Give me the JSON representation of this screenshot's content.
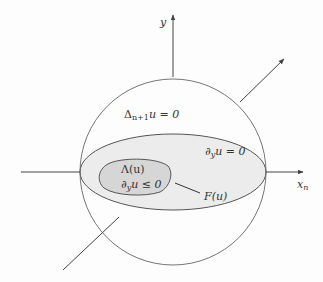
{
  "diagram": {
    "type": "schematic",
    "axes": {
      "vertical": {
        "label": "y"
      },
      "horizontal": {
        "label": "x",
        "subscript": "n"
      }
    },
    "regions": {
      "ball": {
        "label_main": "Δ",
        "label_sub": "n+1",
        "label_rest": "u = 0"
      },
      "ellipse": {
        "label_main": "∂",
        "label_sub": "y",
        "label_rest": "u = 0"
      },
      "contact_set": {
        "name": "Λ(u)",
        "condition_main": "∂",
        "condition_sub": "y",
        "condition_rest": "u ≤ 0"
      }
    },
    "annotations": {
      "free_boundary": "F(u)"
    },
    "colors": {
      "stroke": "#555555",
      "ellipse_fill": "#ececec",
      "contact_fill": "#d6d6d6",
      "background": "#fdfdfd"
    }
  }
}
